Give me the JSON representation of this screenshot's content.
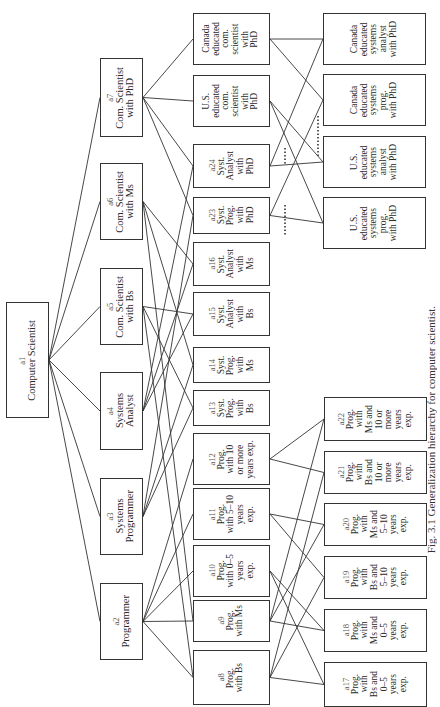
{
  "figure": {
    "caption": "Fig. 3.1    Generalization hierarchy for computer scientist.",
    "orientation": "rotated 90° counterclockwise"
  },
  "nodes": [
    {
      "key": "a1",
      "id": "a1",
      "label": "Computer Scientist",
      "level": 1,
      "box": [
        6,
        302,
        43,
        116
      ]
    },
    {
      "key": "a2",
      "id": "a2",
      "label": "Programmer",
      "level": 2,
      "box": [
        100,
        583,
        43,
        77
      ]
    },
    {
      "key": "a3",
      "id": "a3",
      "label": "Systems\nProgrammer",
      "level": 2,
      "box": [
        100,
        478,
        43,
        77
      ]
    },
    {
      "key": "a4",
      "id": "a4",
      "label": "Systems\nAnalyst",
      "level": 2,
      "box": [
        100,
        372,
        43,
        78
      ]
    },
    {
      "key": "a5",
      "id": "a5",
      "label": "Com. Scientist\nwith Bs",
      "level": 2,
      "box": [
        100,
        268,
        43,
        77
      ]
    },
    {
      "key": "a6",
      "id": "a6",
      "label": "Com. Scientist\nwith Ms",
      "level": 2,
      "box": [
        100,
        163,
        43,
        77
      ]
    },
    {
      "key": "a7",
      "id": "a7",
      "label": "Com. Scientist\nwith PhD",
      "level": 2,
      "box": [
        100,
        58,
        43,
        79
      ]
    },
    {
      "key": "a8",
      "id": "a8",
      "label": "Prog.\nwith Bs",
      "level": 3,
      "box": [
        193,
        650,
        77,
        55
      ]
    },
    {
      "key": "a9",
      "id": "a9",
      "label": "Prog.\nwith Ms",
      "level": 3,
      "box": [
        193,
        600,
        77,
        42
      ]
    },
    {
      "key": "a10",
      "id": "a10",
      "label": "Prog.\nwith 0–5\nyears\nexp.",
      "level": 3,
      "box": [
        193,
        545,
        77,
        52
      ]
    },
    {
      "key": "a11",
      "id": "a11",
      "label": "Prog.\nwith 5–10\nyears\nexp.",
      "level": 3,
      "box": [
        193,
        488,
        77,
        52
      ]
    },
    {
      "key": "a12",
      "id": "a12",
      "label": "Prog.\nwith 10\nor more\nyears exp.",
      "level": 3,
      "box": [
        193,
        433,
        77,
        52
      ]
    },
    {
      "key": "a13",
      "id": "a13",
      "label": "Syst.\nProg.\nwith\nBs",
      "level": 3,
      "box": [
        193,
        390,
        77,
        36
      ]
    },
    {
      "key": "a14",
      "id": "a14",
      "label": "Syst.\nProg.\nwith\nMs",
      "level": 3,
      "box": [
        193,
        347,
        77,
        36
      ]
    },
    {
      "key": "a15",
      "id": "a15",
      "label": "Syst.\nAnalyst\nwith\nBs",
      "level": 3,
      "box": [
        193,
        292,
        77,
        44
      ]
    },
    {
      "key": "a16",
      "id": "a16",
      "label": "Syst.\nAnalyst\nwith\nMs",
      "level": 3,
      "box": [
        193,
        242,
        77,
        44
      ]
    },
    {
      "key": "a23",
      "id": "a23",
      "label": "Syst.\nProg.\nwith\nPhD",
      "level": 3,
      "box": [
        193,
        197,
        77,
        37
      ]
    },
    {
      "key": "a24",
      "id": "a24",
      "label": "Syst.\nAnalyst\nwith\nPhD",
      "level": 3,
      "box": [
        193,
        144,
        77,
        44
      ]
    },
    {
      "key": "us_cs",
      "id": "",
      "label": "U.S.\neducated\ncom.\nscientist\nwith\nPhD",
      "level": 3,
      "box": [
        193,
        75,
        77,
        52
      ]
    },
    {
      "key": "ca_cs",
      "id": "",
      "label": "Canada\neducated\ncom.\nscientist\nwith\nPhD",
      "level": 3,
      "box": [
        193,
        13,
        77,
        52
      ]
    },
    {
      "key": "a17",
      "id": "a17",
      "label": "Prog.\nwith\nBs and\n0–5\nyears\nexp.",
      "level": 4,
      "box": [
        324,
        662,
        103,
        45
      ]
    },
    {
      "key": "a18",
      "id": "a18",
      "label": "Prog.\nwith\nMs and\n0–5\nyears\nexp.",
      "level": 4,
      "box": [
        324,
        609,
        103,
        43
      ]
    },
    {
      "key": "a19",
      "id": "a19",
      "label": "Prog.\nwith\nBs and\n5–10\nyears\nexp.",
      "level": 4,
      "box": [
        324,
        556,
        103,
        43
      ]
    },
    {
      "key": "a20",
      "id": "a20",
      "label": "Prog.\nwith\nMs and\n5–10\nyears\nexp.",
      "level": 4,
      "box": [
        324,
        503,
        103,
        43
      ]
    },
    {
      "key": "a21",
      "id": "a21",
      "label": "Prog.\nwith\nBs and\n10 or\nmore\nyears\nexp.",
      "level": 4,
      "box": [
        324,
        451,
        103,
        43
      ]
    },
    {
      "key": "a22",
      "id": "a22",
      "label": "Prog.\nwith\nMs and\n10 or\nmore\nyears\nexp.",
      "level": 4,
      "box": [
        324,
        397,
        103,
        44
      ]
    },
    {
      "key": "us_sp",
      "id": "",
      "label": "U.S.\neducated\nsystems\nprog.\nwith PhD",
      "level": 4,
      "box": [
        323,
        197,
        103,
        52
      ]
    },
    {
      "key": "us_sa",
      "id": "",
      "label": "U.S.\neducated\nsystems\nanalyst\nwith PhD",
      "level": 4,
      "box": [
        323,
        136,
        103,
        52
      ]
    },
    {
      "key": "ca_sp",
      "id": "",
      "label": "Canada\neducated\nsystems\nprog.\nwith PhD",
      "level": 4,
      "box": [
        323,
        74,
        103,
        52
      ]
    },
    {
      "key": "ca_sa",
      "id": "",
      "label": "Canada\neducated\nsystems\nanalyst\nwith PhD",
      "level": 4,
      "box": [
        323,
        13,
        103,
        52
      ]
    }
  ],
  "edges": [
    [
      "a1",
      "a2"
    ],
    [
      "a1",
      "a3"
    ],
    [
      "a1",
      "a4"
    ],
    [
      "a1",
      "a5"
    ],
    [
      "a1",
      "a6"
    ],
    [
      "a1",
      "a7"
    ],
    [
      "a2",
      "a8"
    ],
    [
      "a2",
      "a9"
    ],
    [
      "a2",
      "a10"
    ],
    [
      "a2",
      "a11"
    ],
    [
      "a2",
      "a12"
    ],
    [
      "a3",
      "a13"
    ],
    [
      "a3",
      "a14"
    ],
    [
      "a3",
      "a23"
    ],
    [
      "a4",
      "a15"
    ],
    [
      "a4",
      "a16"
    ],
    [
      "a4",
      "a24"
    ],
    [
      "a5",
      "a8"
    ],
    [
      "a5",
      "a13"
    ],
    [
      "a5",
      "a15"
    ],
    [
      "a6",
      "a9"
    ],
    [
      "a6",
      "a14"
    ],
    [
      "a6",
      "a16"
    ],
    [
      "a7",
      "a23"
    ],
    [
      "a7",
      "a24"
    ],
    [
      "a7",
      "us_cs"
    ],
    [
      "a7",
      "ca_cs"
    ],
    [
      "a8",
      "a17"
    ],
    [
      "a8",
      "a19"
    ],
    [
      "a8",
      "a21"
    ],
    [
      "a9",
      "a18"
    ],
    [
      "a9",
      "a20"
    ],
    [
      "a9",
      "a22"
    ],
    [
      "a10",
      "a17"
    ],
    [
      "a10",
      "a18"
    ],
    [
      "a11",
      "a19"
    ],
    [
      "a11",
      "a20"
    ],
    [
      "a12",
      "a21"
    ],
    [
      "a12",
      "a22"
    ],
    [
      "a23",
      "us_sp"
    ],
    [
      "a23",
      "ca_sp"
    ],
    [
      "a24",
      "us_sa"
    ],
    [
      "a24",
      "ca_sa"
    ],
    [
      "us_cs",
      "us_sp"
    ],
    [
      "us_cs",
      "us_sa"
    ],
    [
      "ca_cs",
      "ca_sp"
    ],
    [
      "ca_cs",
      "ca_sa"
    ]
  ],
  "dotted_edges": [
    [
      [
        285,
        205
      ],
      [
        285,
        236
      ]
    ],
    [
      [
        285,
        148
      ],
      [
        285,
        164
      ]
    ],
    [
      [
        318,
        116
      ],
      [
        318,
        158
      ]
    ]
  ]
}
